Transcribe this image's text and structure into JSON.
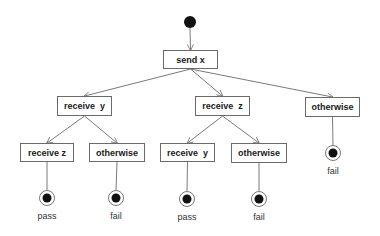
{
  "diagram": {
    "type": "activity-tree",
    "start": {
      "x": 190,
      "y": 22
    },
    "nodes": [
      {
        "id": "n0",
        "label": "send x",
        "x": 163,
        "y": 50,
        "w": 55,
        "h": 19
      },
      {
        "id": "n1",
        "label": "receive  y",
        "x": 57,
        "y": 96,
        "w": 55,
        "h": 20
      },
      {
        "id": "n2",
        "label": "receive  z",
        "x": 195,
        "y": 96,
        "w": 55,
        "h": 20
      },
      {
        "id": "n3",
        "label": "otherwise",
        "x": 305,
        "y": 97,
        "w": 55,
        "h": 20
      },
      {
        "id": "n4",
        "label": "receive z",
        "x": 20,
        "y": 143,
        "w": 54,
        "h": 19
      },
      {
        "id": "n5",
        "label": "otherwise",
        "x": 89,
        "y": 143,
        "w": 56,
        "h": 19
      },
      {
        "id": "n6",
        "label": "receive  y",
        "x": 160,
        "y": 143,
        "w": 55,
        "h": 19
      },
      {
        "id": "n7",
        "label": "otherwise",
        "x": 231,
        "y": 143,
        "w": 56,
        "h": 20
      }
    ],
    "ends": [
      {
        "id": "e1",
        "label": "pass",
        "x": 47,
        "y": 198,
        "from": "n4"
      },
      {
        "id": "e2",
        "label": "fail",
        "x": 116,
        "y": 198,
        "from": "n5"
      },
      {
        "id": "e3",
        "label": "pass",
        "x": 187,
        "y": 199,
        "from": "n6"
      },
      {
        "id": "e4",
        "label": "fail",
        "x": 259,
        "y": 199,
        "from": "n7"
      },
      {
        "id": "e5",
        "label": "fail",
        "x": 333,
        "y": 153,
        "from": "n3"
      }
    ],
    "edges": [
      {
        "from": "start",
        "to": "n0"
      },
      {
        "from": "n0",
        "to": "n1"
      },
      {
        "from": "n0",
        "to": "n2"
      },
      {
        "from": "n0",
        "to": "n3"
      },
      {
        "from": "n1",
        "to": "n4"
      },
      {
        "from": "n1",
        "to": "n5"
      },
      {
        "from": "n2",
        "to": "n6"
      },
      {
        "from": "n2",
        "to": "n7"
      }
    ],
    "colors": {
      "line": "#6a6a6a",
      "dot": "#111111",
      "text": "#1a1a1a"
    }
  }
}
